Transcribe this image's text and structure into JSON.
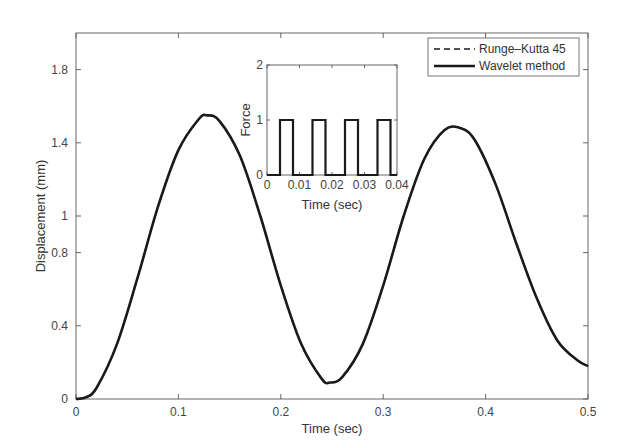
{
  "chart_data": [
    {
      "type": "line",
      "title": "",
      "xlabel": "Time (sec)",
      "ylabel": "Displacement (mm)",
      "xlim": [
        0,
        0.5
      ],
      "ylim": [
        0,
        2
      ],
      "xticks": [
        "0",
        "0.1",
        "0.2",
        "0.3",
        "0.4",
        "0.5"
      ],
      "yticks": [
        "0",
        "0.4",
        "0.8",
        "1",
        "1.4",
        "1.8"
      ],
      "grid": false,
      "legend_position": "upper right",
      "series": [
        {
          "name": "Runge–Kutta 45",
          "style": "dashed",
          "x": [
            0,
            0.01,
            0.02,
            0.04,
            0.06,
            0.08,
            0.1,
            0.12,
            0.128,
            0.14,
            0.16,
            0.18,
            0.2,
            0.22,
            0.24,
            0.248,
            0.26,
            0.28,
            0.3,
            0.32,
            0.34,
            0.36,
            0.376,
            0.39,
            0.41,
            0.43,
            0.45,
            0.47,
            0.49,
            0.5
          ],
          "values": [
            0,
            0.01,
            0.06,
            0.3,
            0.66,
            1.05,
            1.36,
            1.53,
            1.55,
            1.52,
            1.33,
            1.0,
            0.62,
            0.3,
            0.11,
            0.09,
            0.12,
            0.3,
            0.62,
            1.0,
            1.31,
            1.47,
            1.48,
            1.41,
            1.17,
            0.85,
            0.55,
            0.32,
            0.21,
            0.18
          ]
        },
        {
          "name": "Wavelet method",
          "style": "solid",
          "x": [
            0,
            0.01,
            0.02,
            0.04,
            0.06,
            0.08,
            0.1,
            0.12,
            0.128,
            0.14,
            0.16,
            0.18,
            0.2,
            0.22,
            0.24,
            0.248,
            0.26,
            0.28,
            0.3,
            0.32,
            0.34,
            0.36,
            0.376,
            0.39,
            0.41,
            0.43,
            0.45,
            0.47,
            0.49,
            0.5
          ],
          "values": [
            0,
            0.01,
            0.06,
            0.3,
            0.66,
            1.05,
            1.36,
            1.53,
            1.55,
            1.52,
            1.33,
            1.0,
            0.62,
            0.3,
            0.11,
            0.09,
            0.12,
            0.3,
            0.62,
            1.0,
            1.31,
            1.47,
            1.48,
            1.41,
            1.17,
            0.85,
            0.55,
            0.32,
            0.21,
            0.18
          ]
        }
      ]
    },
    {
      "type": "line",
      "title": "",
      "xlabel": "Time (sec)",
      "ylabel": "Force",
      "xlim": [
        0,
        0.04
      ],
      "ylim": [
        0,
        2
      ],
      "xticks": [
        "0",
        "0.01",
        "0.02",
        "0.03",
        "0.04"
      ],
      "yticks": [
        "0",
        "1",
        "2"
      ],
      "grid": false,
      "series": [
        {
          "name": "Force pulse",
          "style": "solid",
          "x": [
            0,
            0.004,
            0.004,
            0.008,
            0.008,
            0.014,
            0.014,
            0.018,
            0.018,
            0.024,
            0.024,
            0.028,
            0.028,
            0.034,
            0.034,
            0.038,
            0.038,
            0.04
          ],
          "values": [
            0,
            0,
            1,
            1,
            0,
            0,
            1,
            1,
            0,
            0,
            1,
            1,
            0,
            0,
            1,
            1,
            0,
            0
          ]
        }
      ]
    }
  ],
  "legend": {
    "items": [
      "Runge–Kutta 45",
      "Wavelet method"
    ]
  },
  "colors": {
    "line": "#1a1a1a",
    "axis": "#555555"
  }
}
